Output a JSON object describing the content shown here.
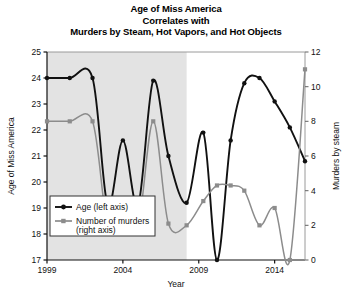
{
  "chart_data": {
    "type": "line",
    "title": "Age of Miss America Correlates with Murders by Steam, Hot Vapors, and Hot Objects",
    "title_lines": [
      "Age of Miss America",
      "Correlates with",
      "Murders by Steam, Hot Vapors, and Hot Objects"
    ],
    "xlabel": "Year",
    "ylabel": "Age of Miss America",
    "y2label": "Murders by steam",
    "xlim": [
      1999,
      2016
    ],
    "ylim": [
      17,
      25
    ],
    "y2lim": [
      0,
      12
    ],
    "xticks": [
      1999,
      2004,
      2009,
      2014
    ],
    "xtick_labels": [
      "1999",
      "2004",
      "2009",
      "2014"
    ],
    "yticks": [
      17,
      18,
      19,
      20,
      21,
      22,
      23,
      24,
      25
    ],
    "ytick_labels": [
      "17",
      "18",
      "19",
      "20",
      "21",
      "22",
      "23",
      "24",
      "25"
    ],
    "y2ticks": [
      0,
      2,
      4,
      6,
      8,
      10,
      12
    ],
    "y2tick_labels": [
      "0",
      "2",
      "4",
      "6",
      "8",
      "10",
      "12"
    ],
    "grid": false,
    "legend_position": "lower-left",
    "shaded_band": {
      "from": 1999,
      "to": 2008.2,
      "color": "#e3e3e3"
    },
    "x": [
      1999,
      2000.5,
      2002,
      2003,
      2004,
      2005,
      2006,
      2007,
      2008.2,
      2009.3,
      2010.2,
      2011.1,
      2012,
      2013,
      2014,
      2015,
      2016
    ],
    "series": [
      {
        "name": "Age (left axis)",
        "axis": "left",
        "color": "#111111",
        "marker": "circle",
        "values": [
          24.0,
          24.0,
          24.0,
          19.1,
          21.6,
          19.1,
          23.9,
          21.0,
          19.2,
          21.9,
          17.0,
          21.6,
          23.8,
          24.0,
          23.1,
          22.1,
          20.8
        ]
      },
      {
        "name": "Number of murders (right axis)",
        "axis": "right",
        "color": "#8c8c8c",
        "marker": "square",
        "values": [
          8.0,
          8.0,
          8.0,
          2.0,
          3.0,
          2.0,
          8.0,
          2.1,
          2.0,
          3.4,
          4.3,
          4.3,
          4.0,
          2.0,
          3.0,
          0.0,
          11.0
        ]
      }
    ]
  },
  "legend": {
    "entries": [
      {
        "label": "Age (left axis)",
        "color": "#111111",
        "marker": "circle"
      },
      {
        "label": "Number of murders",
        "label2": "(right axis)",
        "color": "#8c8c8c",
        "marker": "square"
      }
    ]
  }
}
